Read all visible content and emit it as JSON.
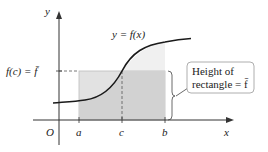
{
  "diagram": {
    "axes": {
      "x_label": "x",
      "y_label": "y",
      "origin_label": "O"
    },
    "curve_label": "y = f(x)",
    "points": {
      "a": "a",
      "c": "c",
      "b": "b"
    },
    "fbar_label": "f(c) = f̄",
    "callout": {
      "line1": "Height of",
      "line2": "rectangle = f̄"
    },
    "colors": {
      "curve": "#1a1a1a",
      "axis": "#333333",
      "rect_fill": "#dcdcdc",
      "under_curve_fill": "#ececec",
      "callout_border": "#999999"
    }
  }
}
